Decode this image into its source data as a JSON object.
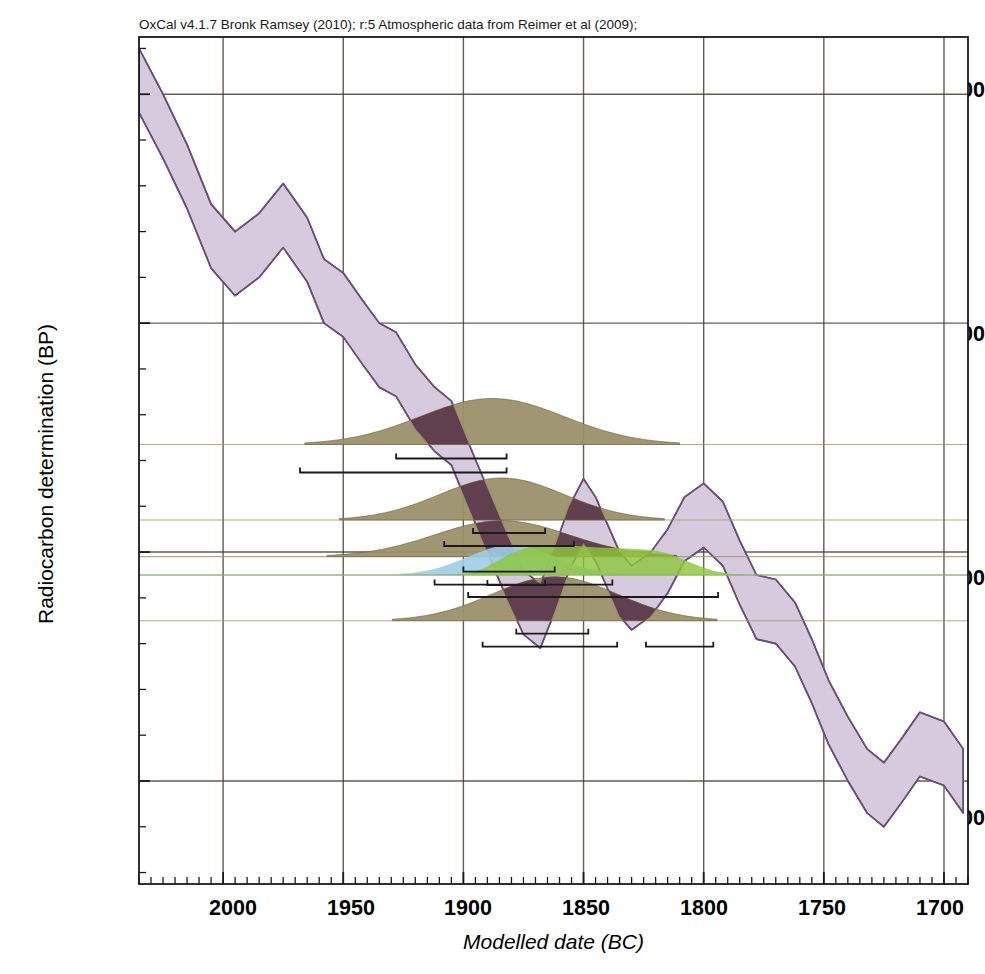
{
  "header": {
    "caption": "OxCal v4.1.7 Bronk Ramsey (2010); r:5 Atmospheric data from Reimer et al (2009);"
  },
  "axes": {
    "ylabel": "Radiocarbon determination (BP)",
    "xlabel": "Modelled date (BC)",
    "yticks": [
      "3700",
      "3600",
      "3500",
      "3400"
    ],
    "xticks": [
      "2000",
      "1950",
      "1900",
      "1850",
      "1800",
      "1750",
      "1700"
    ]
  },
  "samples": {
    "a": "A: OxA-10124",
    "b1": "B: L927",
    "b2": "B: OxA-10284",
    "c": "C: L626",
    "g": "G: L1103",
    "e": "E: L1164"
  },
  "colors": {
    "calibration_band_fill": "#d7cadf",
    "calibration_band_stroke": "#6b4f73",
    "distribution_olive": "#9b9069",
    "distribution_overlap": "#5d3a4c",
    "distribution_blue": "#9fcde2",
    "distribution_green": "#8fc63d",
    "grid": "#4a4038",
    "axis": "#1a1a1a"
  },
  "chart_data": {
    "type": "area",
    "title": "OxCal v4.1.7 Bronk Ramsey (2010); r:5 Atmospheric data from Reimer et al (2009);",
    "xlabel": "Modelled date (BC)",
    "ylabel": "Radiocarbon determination (BP)",
    "xlim": [
      2035,
      1690
    ],
    "ylim": [
      3355,
      3725
    ],
    "x_tick_values": [
      2000,
      1950,
      1900,
      1850,
      1800,
      1750,
      1700
    ],
    "y_tick_values": [
      3700,
      3600,
      3500,
      3400
    ],
    "x_minor_step": 5,
    "y_minor_step": 20,
    "grid": true,
    "legend": "none",
    "x_axis_direction": "decreasing",
    "calibration_curve": {
      "name": "IntCal09 atmospheric calibration curve (1-sigma envelope)",
      "fill": "#d7cadf",
      "stroke": "#6b4f73",
      "x": [
        2035,
        2025,
        2015,
        2005,
        1995,
        1985,
        1975,
        1965,
        1958,
        1950,
        1942,
        1935,
        1928,
        1920,
        1912,
        1905,
        1898,
        1890,
        1882,
        1875,
        1868,
        1862,
        1856,
        1850,
        1845,
        1840,
        1835,
        1830,
        1822,
        1815,
        1808,
        1800,
        1792,
        1785,
        1778,
        1770,
        1762,
        1755,
        1748,
        1740,
        1732,
        1725,
        1718,
        1710,
        1700,
        1692
      ],
      "y_upper": [
        3720,
        3700,
        3678,
        3652,
        3640,
        3648,
        3661,
        3646,
        3628,
        3622,
        3610,
        3600,
        3596,
        3582,
        3572,
        3566,
        3548,
        3528,
        3508,
        3492,
        3486,
        3502,
        3520,
        3532,
        3524,
        3512,
        3500,
        3494,
        3500,
        3510,
        3524,
        3530,
        3522,
        3505,
        3490,
        3488,
        3478,
        3462,
        3444,
        3428,
        3414,
        3408,
        3418,
        3430,
        3426,
        3414
      ],
      "y_lower": [
        3692,
        3672,
        3650,
        3624,
        3612,
        3620,
        3633,
        3618,
        3600,
        3594,
        3582,
        3572,
        3568,
        3554,
        3544,
        3538,
        3520,
        3500,
        3480,
        3464,
        3458,
        3474,
        3492,
        3504,
        3496,
        3484,
        3472,
        3466,
        3472,
        3482,
        3496,
        3502,
        3494,
        3477,
        3462,
        3460,
        3450,
        3434,
        3416,
        3400,
        3386,
        3380,
        3390,
        3402,
        3398,
        3386
      ]
    },
    "distributions": [
      {
        "name": "A: OxA-10124",
        "label": "A: OxA-10124",
        "baseline_bp": 3547,
        "color": "#9b9069",
        "overlap_color": "#5d3a4c",
        "peak_date_bc": 1888,
        "spread_bc": 30,
        "range_1sigma": [
          [
            1928,
            1882
          ]
        ],
        "range_2sigma": [
          [
            1968,
            1882
          ]
        ]
      },
      {
        "name": "B: L927",
        "label": "B: L927",
        "baseline_bp": 3514,
        "color": "#9b9069",
        "overlap_color": "#5d3a4c",
        "peak_date_bc": 1884,
        "spread_bc": 26,
        "range_1sigma": [
          [
            1896,
            1866
          ]
        ],
        "range_2sigma": [
          [
            1908,
            1854
          ]
        ]
      },
      {
        "name": "B: OxA-10284",
        "label": "B: OxA-10284",
        "baseline_bp": 3498,
        "color": "#9b9069",
        "overlap_color": "#5d3a4c",
        "peak_date_bc": 1884,
        "spread_bc": 28,
        "range_1sigma": [
          [
            1900,
            1862
          ]
        ],
        "range_2sigma": [
          [
            1912,
            1838
          ]
        ]
      },
      {
        "name": "C: L626",
        "label": "C: L626",
        "baseline_bp": 3490,
        "color": "#9fcde2",
        "peak_date_bc": 1880,
        "spread_bc": 18,
        "range_1sigma": [
          [
            1890,
            1866
          ]
        ],
        "range_2sigma": [
          [
            1898,
            1858
          ]
        ]
      },
      {
        "name": "G: L1103",
        "label": "G: L1103",
        "baseline_bp": 3490,
        "color": "#8fc63d",
        "peak_date_bc": 1856,
        "spread_bc": 46,
        "range_1sigma": [
          [
            1884,
            1816
          ]
        ],
        "range_2sigma": [
          [
            1898,
            1794
          ]
        ]
      },
      {
        "name": "E: L1164",
        "label": "E: L1164",
        "baseline_bp": 3470,
        "color": "#9b9069",
        "overlap_color": "#5d3a4c",
        "peak_date_bc": 1862,
        "spread_bc": 26,
        "range_1sigma": [
          [
            1878,
            1848
          ]
        ],
        "range_2sigma": [
          [
            1892,
            1836
          ],
          [
            1824,
            1796
          ]
        ]
      }
    ]
  }
}
